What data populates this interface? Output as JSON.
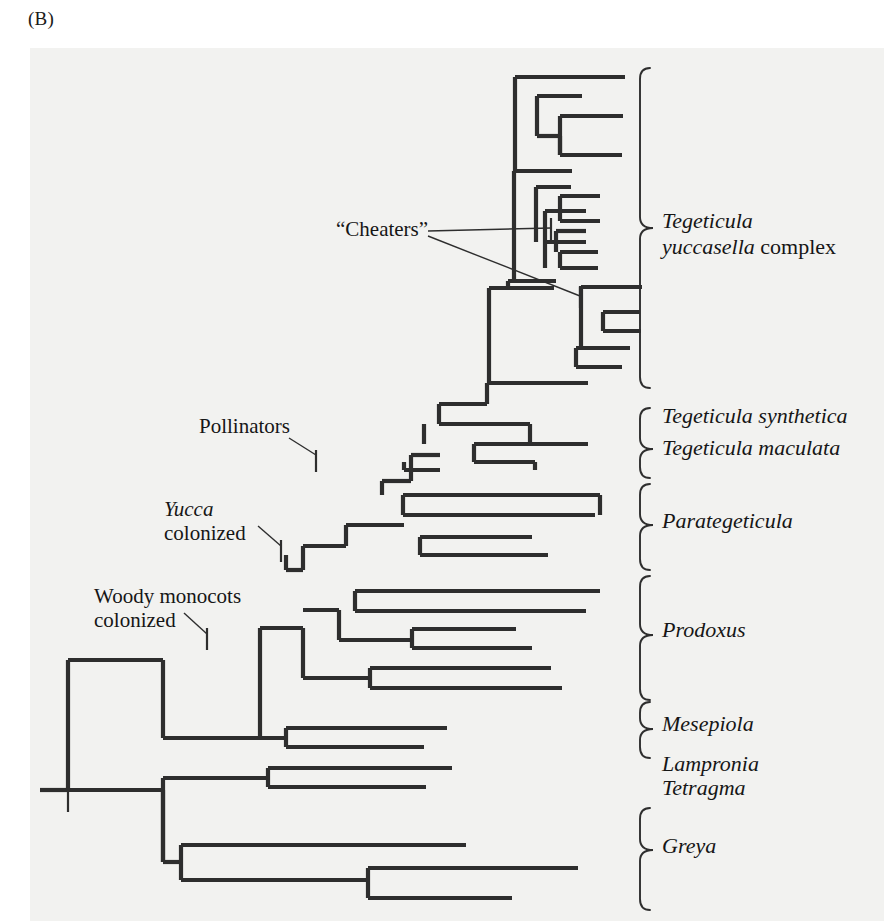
{
  "panel": {
    "label": "(B)",
    "background_color": "#f2f2f0",
    "line_color": "#2e2e2e",
    "text_color": "#161616",
    "x": 30,
    "y": 48,
    "width": 854,
    "height": 873
  },
  "figure": {
    "type": "phylogenetic-cladogram"
  },
  "clade_labels": [
    {
      "id": "tegeticula-yuccasella",
      "lines": [
        {
          "text": "Tegeticula",
          "style": "italic"
        },
        {
          "text": "yuccasella complex",
          "style": "italic-then-roman",
          "italic_part": "yuccasella",
          "roman_part": " complex"
        }
      ],
      "text_x": 662,
      "text_y": 228,
      "line_height": 26,
      "brace": {
        "x": 640,
        "top": 68,
        "bottom": 388,
        "tip_y": 228
      }
    },
    {
      "id": "tegeticula-synthetica",
      "lines": [
        {
          "text": "Tegeticula synthetica",
          "style": "italic"
        }
      ],
      "text_x": 662,
      "text_y": 423,
      "line_height": 26,
      "brace": null
    },
    {
      "id": "tegeticula-maculata",
      "lines": [
        {
          "text": "Tegeticula maculata",
          "style": "italic"
        }
      ],
      "text_x": 662,
      "text_y": 455,
      "line_height": 26,
      "brace": {
        "x": 640,
        "top": 408,
        "bottom": 478,
        "tip_y": 449
      }
    },
    {
      "id": "parategeticula",
      "lines": [
        {
          "text": "Parategeticula",
          "style": "italic"
        }
      ],
      "text_x": 662,
      "text_y": 528,
      "line_height": 26,
      "brace": {
        "x": 640,
        "top": 484,
        "bottom": 570,
        "tip_y": 525
      }
    },
    {
      "id": "prodoxus",
      "lines": [
        {
          "text": "Prodoxus",
          "style": "italic"
        }
      ],
      "text_x": 662,
      "text_y": 637,
      "line_height": 26,
      "brace": {
        "x": 640,
        "top": 576,
        "bottom": 700,
        "tip_y": 635
      }
    },
    {
      "id": "mesepiola",
      "lines": [
        {
          "text": "Mesepiola",
          "style": "italic"
        }
      ],
      "text_x": 662,
      "text_y": 731,
      "line_height": 26,
      "brace": {
        "x": 640,
        "top": 702,
        "bottom": 758,
        "tip_y": 729
      }
    },
    {
      "id": "lampronia-tetragma",
      "lines": [
        {
          "text": "Lampronia",
          "style": "italic"
        },
        {
          "text": "Tetragma",
          "style": "italic"
        }
      ],
      "text_x": 662,
      "text_y": 771,
      "line_height": 24,
      "brace": null
    },
    {
      "id": "greya",
      "lines": [
        {
          "text": "Greya",
          "style": "italic"
        }
      ],
      "text_x": 662,
      "text_y": 853,
      "line_height": 26,
      "brace": {
        "x": 640,
        "top": 808,
        "bottom": 910,
        "tip_y": 850
      }
    }
  ],
  "annotations": [
    {
      "id": "cheaters",
      "text": "“Cheaters”",
      "style": "roman",
      "text_x": 336,
      "text_y": 236,
      "anchor": "start",
      "leaders": [
        {
          "x1": 428,
          "y1": 231,
          "x2": 551,
          "y2": 228
        },
        {
          "x1": 428,
          "y1": 236,
          "x2": 580,
          "y2": 296
        }
      ],
      "ticks": [
        {
          "x": 551,
          "y": 218,
          "len": 22,
          "orient": "vertical"
        },
        {
          "x": 580,
          "y": 286,
          "len": 22,
          "orient": "vertical"
        }
      ]
    },
    {
      "id": "pollinators",
      "text": "Pollinators",
      "style": "roman",
      "text_x": 199,
      "text_y": 433,
      "anchor": "start",
      "leaders": [
        {
          "x1": 289,
          "y1": 438,
          "x2": 316,
          "y2": 455
        }
      ],
      "ticks": [
        {
          "x": 316,
          "y": 450,
          "len": 22,
          "orient": "vertical"
        }
      ]
    },
    {
      "id": "yucca-colonized",
      "lines": [
        {
          "text": "Yucca",
          "style": "italic"
        },
        {
          "text": "colonized",
          "style": "roman"
        }
      ],
      "text_x": 164,
      "text_y": 516,
      "line_height": 24,
      "anchor": "start",
      "leaders": [
        {
          "x1": 258,
          "y1": 526,
          "x2": 281,
          "y2": 546
        }
      ],
      "ticks": [
        {
          "x": 281,
          "y": 540,
          "len": 22,
          "orient": "vertical"
        }
      ]
    },
    {
      "id": "woody-monocots-colonized",
      "lines": [
        {
          "text": "Woody monocots",
          "style": "roman"
        },
        {
          "text": "colonized",
          "style": "roman"
        }
      ],
      "text_x": 94,
      "text_y": 603,
      "line_height": 24,
      "anchor": "start",
      "leaders": [
        {
          "x1": 184,
          "y1": 613,
          "x2": 207,
          "y2": 634
        }
      ],
      "ticks": [
        {
          "x": 207,
          "y": 628,
          "len": 22,
          "orient": "vertical"
        }
      ]
    }
  ],
  "root_tick": {
    "x": 68,
    "y": 790,
    "len": 22,
    "orient": "vertical"
  },
  "tree_branches": {
    "stroke_width": 4.2,
    "horizontals": [
      [
        40,
        68,
        790
      ],
      [
        515,
        625,
        77
      ],
      [
        537,
        582,
        96
      ],
      [
        560,
        623,
        116
      ],
      [
        537,
        562,
        136
      ],
      [
        560,
        622,
        155
      ],
      [
        514,
        572,
        171
      ],
      [
        536,
        571,
        187
      ],
      [
        560,
        600,
        196
      ],
      [
        545,
        586,
        211
      ],
      [
        560,
        600,
        221
      ],
      [
        556,
        586,
        231
      ],
      [
        545,
        586,
        242
      ],
      [
        560,
        598,
        252
      ],
      [
        560,
        598,
        268
      ],
      [
        508,
        556,
        281
      ],
      [
        489,
        554,
        288
      ],
      [
        581,
        642,
        287
      ],
      [
        603,
        640,
        312
      ],
      [
        603,
        641,
        331
      ],
      [
        576,
        630,
        348
      ],
      [
        576,
        622,
        367
      ],
      [
        487,
        588,
        383
      ],
      [
        439,
        487,
        404
      ],
      [
        439,
        530,
        424
      ],
      [
        474,
        588,
        444
      ],
      [
        474,
        535,
        462
      ],
      [
        411,
        440,
        455
      ],
      [
        404,
        440,
        470
      ],
      [
        382,
        411,
        481
      ],
      [
        403,
        600,
        495
      ],
      [
        403,
        595,
        515
      ],
      [
        420,
        532,
        537
      ],
      [
        420,
        548,
        555
      ],
      [
        346,
        404,
        525
      ],
      [
        303,
        346,
        546
      ],
      [
        286,
        303,
        570
      ],
      [
        355,
        600,
        591
      ],
      [
        355,
        586,
        611
      ],
      [
        412,
        516,
        629
      ],
      [
        412,
        532,
        648
      ],
      [
        339,
        412,
        640
      ],
      [
        370,
        551,
        668
      ],
      [
        370,
        562,
        688
      ],
      [
        303,
        370,
        678
      ],
      [
        303,
        339,
        610
      ],
      [
        260,
        303,
        628
      ],
      [
        286,
        447,
        728
      ],
      [
        286,
        424,
        747
      ],
      [
        163,
        286,
        738
      ],
      [
        268,
        452,
        768
      ],
      [
        268,
        426,
        787
      ],
      [
        163,
        268,
        778
      ],
      [
        68,
        163,
        660
      ],
      [
        68,
        163,
        790
      ],
      [
        181,
        466,
        845
      ],
      [
        181,
        368,
        880
      ],
      [
        368,
        578,
        868
      ],
      [
        368,
        512,
        898
      ],
      [
        163,
        181,
        862
      ]
    ],
    "verticals": [
      [
        515,
        77,
        171
      ],
      [
        537,
        96,
        136
      ],
      [
        560,
        116,
        155
      ],
      [
        560,
        136,
        155
      ],
      [
        514,
        171,
        281
      ],
      [
        536,
        187,
        242
      ],
      [
        560,
        196,
        221
      ],
      [
        545,
        211,
        242
      ],
      [
        556,
        231,
        252
      ],
      [
        560,
        252,
        268
      ],
      [
        545,
        242,
        268
      ],
      [
        508,
        281,
        288
      ],
      [
        489,
        288,
        383
      ],
      [
        581,
        287,
        348
      ],
      [
        603,
        312,
        331
      ],
      [
        576,
        348,
        367
      ],
      [
        487,
        383,
        404
      ],
      [
        439,
        404,
        424
      ],
      [
        474,
        444,
        462
      ],
      [
        411,
        455,
        481
      ],
      [
        404,
        462,
        470
      ],
      [
        382,
        481,
        495
      ],
      [
        403,
        495,
        515
      ],
      [
        420,
        537,
        555
      ],
      [
        346,
        525,
        546
      ],
      [
        303,
        546,
        570
      ],
      [
        286,
        555,
        570
      ],
      [
        355,
        591,
        611
      ],
      [
        412,
        629,
        648
      ],
      [
        339,
        610,
        640
      ],
      [
        370,
        668,
        688
      ],
      [
        303,
        628,
        678
      ],
      [
        260,
        628,
        738
      ],
      [
        286,
        728,
        747
      ],
      [
        163,
        660,
        738
      ],
      [
        268,
        768,
        787
      ],
      [
        163,
        778,
        862
      ],
      [
        68,
        660,
        790
      ],
      [
        181,
        845,
        880
      ],
      [
        368,
        868,
        898
      ],
      [
        163,
        790,
        862
      ],
      [
        424,
        424,
        444
      ],
      [
        530,
        424,
        444
      ],
      [
        535,
        462,
        470
      ],
      [
        600,
        495,
        515
      ]
    ]
  }
}
